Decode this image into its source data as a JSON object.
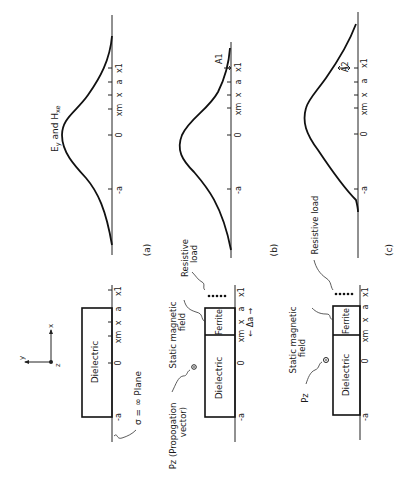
{
  "figure": {
    "orientation": "rotated 90° counter-clockwise",
    "panels": [
      {
        "id": "a",
        "caption": "(a)",
        "curve_label": "Ey and Hxe",
        "curve_label_main": "E",
        "curve_label_sub1": "y",
        "curve_label_mid": " and H",
        "curve_label_sub2": "xe",
        "axis_ticks": [
          "x1",
          "a",
          "x",
          "xm",
          "0",
          "-a"
        ],
        "structure": {
          "material": "Dielectric",
          "ticks": [
            "x1",
            "a",
            "x",
            "xm",
            "0",
            "-a"
          ],
          "boundary_label": "σ = ∞ Plane"
        }
      },
      {
        "id": "b",
        "caption": "(b)",
        "curve_marker": "A1",
        "axis_ticks": [
          "x1",
          "a",
          "x",
          "xm",
          "0",
          "-a"
        ],
        "structure": {
          "materials": [
            "Dielectric",
            "Ferrite"
          ],
          "ticks": [
            "x1",
            "a",
            "x",
            "xm",
            "0",
            "-a"
          ],
          "labels": {
            "static_field": "Static magnetic field",
            "static_field_l1": "Static magnetic",
            "static_field_l2": "field",
            "resistive_load_l1": "Resistive",
            "resistive_load_l2": "load",
            "propagation_l1": "Pz (Propogation",
            "propagation_l2": "vector)",
            "delta": "← Δa →"
          }
        }
      },
      {
        "id": "c",
        "caption": "(c)",
        "curve_marker": "A2",
        "axis_ticks": [
          "x1",
          "a",
          "x",
          "xm",
          "0",
          "-a"
        ],
        "structure": {
          "materials": [
            "Dielectric",
            "Ferrite"
          ],
          "ticks": [
            "x1",
            "a",
            "x",
            "xm",
            "0",
            "-a"
          ],
          "labels": {
            "static_field_l1": "Static magnetic",
            "static_field_l2": "field",
            "resistive_load": "Resistive load",
            "propagation": "Pz"
          }
        }
      }
    ],
    "coordinate_axes": {
      "x": "x",
      "y": "y",
      "z": "z"
    }
  }
}
